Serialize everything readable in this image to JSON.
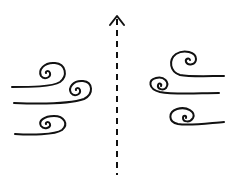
{
  "diagram": {
    "colors": {
      "background": "#ffffff",
      "ink": "#111111"
    },
    "center_arrow": {
      "direction": "up",
      "style": "dashed",
      "x": 117,
      "y_top": 16,
      "y_bottom": 175
    },
    "left_gusts": [
      {
        "id": "left-top",
        "spiral_center": [
          47,
          73
        ],
        "line_start": [
          12,
          87
        ]
      },
      {
        "id": "left-middle",
        "spiral_center": [
          77,
          90
        ],
        "line_start": [
          14,
          103
        ]
      },
      {
        "id": "left-bottom",
        "spiral_center": [
          48,
          124
        ],
        "line_start": [
          15,
          134
        ]
      }
    ],
    "right_gusts": [
      {
        "id": "right-top",
        "spiral_center": [
          190,
          61
        ],
        "line_end": [
          224,
          76
        ]
      },
      {
        "id": "right-middle",
        "spiral_center": [
          161,
          86
        ],
        "line_end": [
          219,
          93
        ]
      },
      {
        "id": "right-bottom",
        "spiral_center": [
          185,
          118
        ],
        "line_end": [
          224,
          122
        ]
      }
    ]
  }
}
